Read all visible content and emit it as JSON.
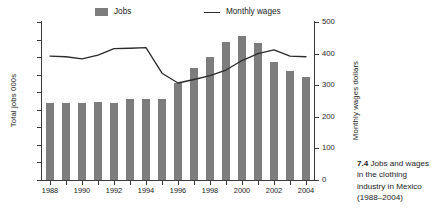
{
  "caption": {
    "number": "7.4",
    "text": "Jobs and wages in the clothing industry in Mexico (1988–2004)"
  },
  "legend": {
    "jobs_label": "Jobs",
    "wages_label": "Monthly wages"
  },
  "axes": {
    "left_title": "Total jobs 000s",
    "right_title": "Monthly wages dollars",
    "left_ticks": [
      "0",
      "50",
      "100",
      "150",
      "200",
      "250",
      "300",
      "350",
      "400",
      "450"
    ],
    "right_ticks": [
      "0",
      "100",
      "200",
      "300",
      "400",
      "500"
    ],
    "x_ticks": [
      "1988",
      "1990",
      "1992",
      "1994",
      "1996",
      "1998",
      "2000",
      "2002",
      "2004"
    ]
  },
  "colors": {
    "bar": "#7d7d7d",
    "line": "#2b2b2b",
    "axis": "#3a3a3a",
    "text": "#1a1a1a",
    "background": "#ffffff"
  },
  "chart_data": {
    "type": "bar",
    "xlabel": "",
    "ylabel": "Total jobs 000s",
    "y2label": "Monthly wages dollars",
    "ylim": [
      0,
      450
    ],
    "y2lim": [
      0,
      500
    ],
    "ytick_step": 50,
    "y2tick_step": 100,
    "grid": false,
    "legend_position": "top",
    "categories": [
      "1988",
      "1989",
      "1990",
      "1991",
      "1992",
      "1993",
      "1994",
      "1995",
      "1996",
      "1997",
      "1998",
      "1999",
      "2000",
      "2001",
      "2002",
      "2003",
      "2004"
    ],
    "x_tick_labels": [
      "1988",
      "",
      "1990",
      "",
      "1992",
      "",
      "1994",
      "",
      "1996",
      "",
      "1998",
      "",
      "2000",
      "",
      "2002",
      "",
      "2004"
    ],
    "series": [
      {
        "name": "Jobs",
        "type": "bar",
        "axis": "left",
        "unit": "thousands of jobs",
        "color": "#7d7d7d",
        "values": [
          218,
          218,
          220,
          221,
          220,
          230,
          231,
          232,
          276,
          320,
          351,
          392,
          409,
          391,
          337,
          311,
          292
        ]
      },
      {
        "name": "Monthly wages",
        "type": "line",
        "axis": "right",
        "unit": "US dollars per month",
        "color": "#2b2b2b",
        "values": [
          392,
          390,
          383,
          395,
          416,
          417,
          419,
          338,
          307,
          318,
          330,
          348,
          378,
          400,
          412,
          392,
          390
        ]
      }
    ]
  }
}
